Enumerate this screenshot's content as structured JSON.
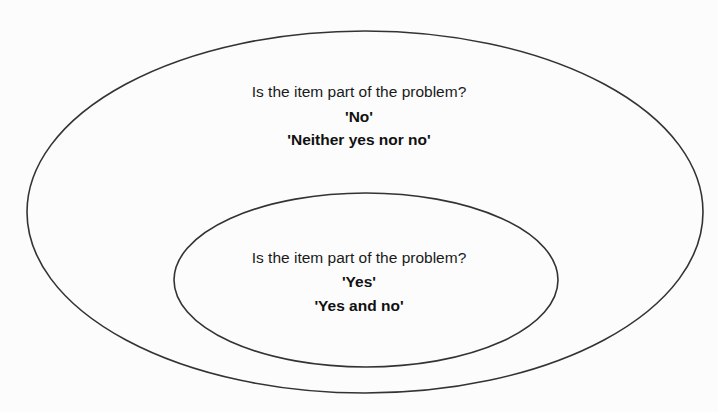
{
  "diagram": {
    "type": "nested-sets",
    "outer_set": {
      "question": "Is the item part of the problem?",
      "answers": [
        "'No'",
        "'Neither yes nor no'"
      ]
    },
    "inner_set": {
      "question": "Is the item part of the problem?",
      "answers": [
        "'Yes'",
        "'Yes and no'"
      ]
    },
    "colors": {
      "stroke": "#333333",
      "text": "#1a1a1a",
      "background": "#fcfcfc"
    }
  }
}
